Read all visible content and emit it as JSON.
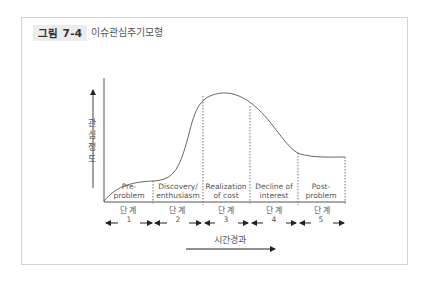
{
  "figure": {
    "number_label": "그림 7-4",
    "title": "이슈관심주기모형"
  },
  "diagram": {
    "y_axis_label": [
      "관",
      "심",
      "정",
      "도"
    ],
    "x_axis_label": "시간경과",
    "stages": [
      {
        "name_line1": "Pre-",
        "name_line2": "problem",
        "step_label": "단 계",
        "step_number": "1"
      },
      {
        "name_line1": "Discovery/",
        "name_line2": "enthusiasm",
        "step_label": "단 계",
        "step_number": "2"
      },
      {
        "name_line1": "Realization",
        "name_line2": "of cost",
        "step_label": "단 계",
        "step_number": "3"
      },
      {
        "name_line1": "Decline of",
        "name_line2": "interest",
        "step_label": "단 계",
        "step_number": "4"
      },
      {
        "name_line1": "Post-",
        "name_line2": "problem",
        "step_label": "단 계",
        "step_number": "5"
      }
    ],
    "colors": {
      "line": "#555555",
      "badge_bg": "#ececec",
      "frame": "#d4d4d4"
    }
  }
}
